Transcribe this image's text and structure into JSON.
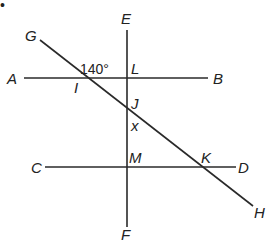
{
  "figure": {
    "lines": [
      {
        "name": "AB",
        "from": "A",
        "to": "B",
        "x1": 24,
        "y1": 78,
        "x2": 208,
        "y2": 78
      },
      {
        "name": "CD",
        "from": "C",
        "to": "D",
        "x1": 45,
        "y1": 167,
        "x2": 236,
        "y2": 167
      },
      {
        "name": "EF",
        "from": "E",
        "to": "F",
        "x1": 127,
        "y1": 30,
        "x2": 127,
        "y2": 227
      },
      {
        "name": "GH",
        "from": "G",
        "to": "H",
        "x1": 40,
        "y1": 40,
        "x2": 253,
        "y2": 206
      }
    ],
    "labels": {
      "A": "A",
      "B": "B",
      "C": "C",
      "D": "D",
      "E": "E",
      "F": "F",
      "G": "G",
      "H": "H",
      "I": "I",
      "J": "J",
      "K": "K",
      "L": "L",
      "M": "M",
      "x": "x"
    },
    "angle_label": "140°",
    "bullet": "•"
  }
}
